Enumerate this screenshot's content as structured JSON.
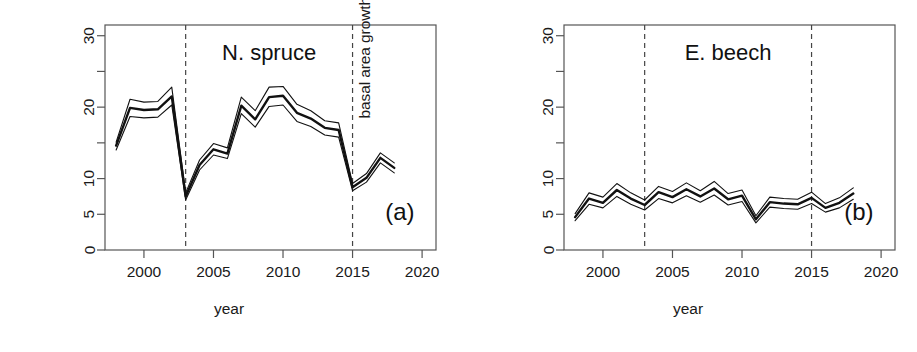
{
  "figure": {
    "axis_label_x": "year",
    "axis_label_y_prefix": "basal area growth (cm",
    "axis_label_y_sup": "2",
    "axis_label_y_suffix": "/yr)"
  },
  "chart_data": [
    {
      "type": "line",
      "panel_tag": "(a)",
      "title": "N. spruce",
      "xlabel": "year",
      "ylabel": "basal area growth (cm²/yr)",
      "xlim": [
        1997.2,
        2021.0
      ],
      "ylim": [
        0,
        31.5
      ],
      "xticks": [
        2000,
        2005,
        2010,
        2015,
        2020
      ],
      "xtick_labels": [
        "2000",
        "2005",
        "2010",
        "2015",
        "2020"
      ],
      "yticks": [
        0,
        5,
        10,
        15,
        20,
        25,
        30
      ],
      "ytick_labels": [
        "0",
        "5",
        "10",
        "",
        "20",
        "",
        "30"
      ],
      "grid": false,
      "legend": "none",
      "vertical_reference_lines": [
        2003,
        2015
      ],
      "x": [
        1998,
        1999,
        2000,
        2001,
        2002,
        2003,
        2004,
        2005,
        2006,
        2007,
        2008,
        2009,
        2010,
        2011,
        2012,
        2013,
        2014,
        2015,
        2016,
        2017,
        2018
      ],
      "series": [
        {
          "name": "mean",
          "values": [
            14.6,
            19.9,
            19.6,
            19.7,
            21.5,
            7.5,
            11.9,
            14.1,
            13.5,
            20.2,
            18.3,
            21.4,
            21.6,
            19.2,
            18.4,
            17.1,
            16.8,
            8.8,
            10.1,
            12.9,
            11.5
          ]
        },
        {
          "name": "upper",
          "values": [
            15.1,
            21.1,
            20.7,
            20.8,
            22.8,
            8.0,
            12.6,
            14.9,
            14.3,
            21.4,
            19.5,
            22.8,
            22.9,
            20.4,
            19.5,
            18.1,
            17.8,
            9.3,
            10.7,
            13.6,
            12.2
          ]
        },
        {
          "name": "lower",
          "values": [
            14.0,
            18.7,
            18.5,
            18.6,
            20.3,
            7.0,
            11.2,
            13.3,
            12.8,
            19.1,
            17.2,
            20.1,
            20.3,
            18.0,
            17.3,
            16.1,
            15.8,
            8.3,
            9.5,
            12.2,
            10.8
          ]
        }
      ]
    },
    {
      "type": "line",
      "panel_tag": "(b)",
      "title": "E. beech",
      "xlabel": "year",
      "ylabel": "basal area growth (cm²/yr)",
      "xlim": [
        1997.2,
        2021.0
      ],
      "ylim": [
        0,
        31.5
      ],
      "xticks": [
        2000,
        2005,
        2010,
        2015,
        2020
      ],
      "xtick_labels": [
        "2000",
        "2005",
        "2010",
        "2015",
        "2020"
      ],
      "yticks": [
        0,
        5,
        10,
        15,
        20,
        25,
        30
      ],
      "ytick_labels": [
        "0",
        "5",
        "10",
        "",
        "20",
        "",
        "30"
      ],
      "grid": false,
      "legend": "none",
      "vertical_reference_lines": [
        2003,
        2015
      ],
      "x": [
        1998,
        1999,
        2000,
        2001,
        2002,
        2003,
        2004,
        2005,
        2006,
        2007,
        2008,
        2009,
        2010,
        2011,
        2012,
        2013,
        2014,
        2015,
        2016,
        2017,
        2018
      ],
      "series": [
        {
          "name": "mean",
          "values": [
            4.6,
            7.2,
            6.6,
            8.4,
            7.2,
            6.3,
            8.1,
            7.4,
            8.5,
            7.5,
            8.6,
            7.1,
            7.6,
            4.3,
            6.7,
            6.5,
            6.4,
            7.3,
            5.9,
            6.6,
            7.9
          ]
        },
        {
          "name": "upper",
          "values": [
            5.1,
            8.0,
            7.4,
            9.3,
            8.0,
            7.0,
            8.9,
            8.2,
            9.4,
            8.3,
            9.6,
            7.9,
            8.4,
            4.8,
            7.4,
            7.2,
            7.1,
            8.1,
            6.5,
            7.3,
            8.7
          ]
        },
        {
          "name": "lower",
          "values": [
            4.1,
            6.4,
            5.9,
            7.5,
            6.4,
            5.6,
            7.2,
            6.6,
            7.6,
            6.7,
            7.7,
            6.3,
            6.8,
            3.8,
            6.0,
            5.8,
            5.7,
            6.5,
            5.3,
            5.9,
            7.1
          ]
        }
      ]
    }
  ]
}
